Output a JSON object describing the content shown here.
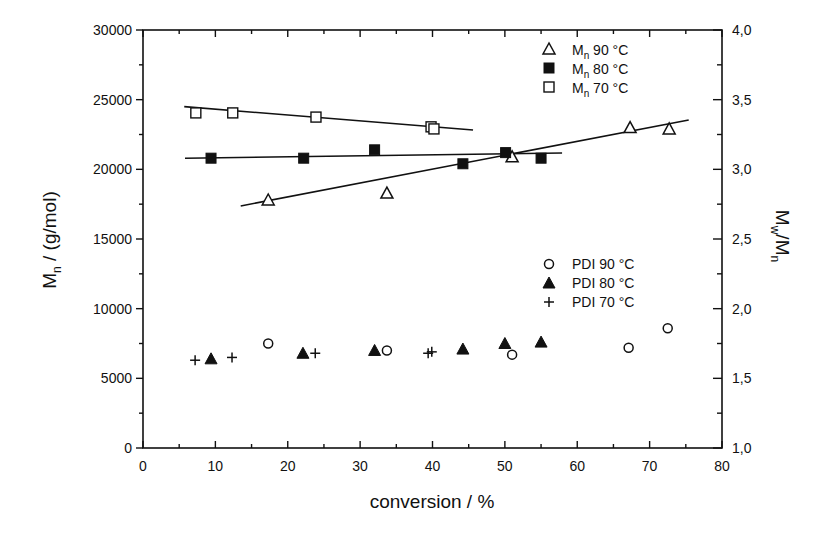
{
  "chart_data": {
    "type": "scatter",
    "title": "",
    "xlabel": "conversion / %",
    "ylabel": {
      "main": "M",
      "sub": "n",
      "rest": " / (g/mol)"
    },
    "y2label": {
      "m1": "M",
      "sub1": "w",
      "slash": "/M",
      "sub2": "n"
    },
    "xlim": [
      0,
      80
    ],
    "ylim": [
      0,
      30000
    ],
    "y2lim": [
      1.0,
      4.0
    ],
    "grid": false,
    "x_ticks": [
      "0",
      "10",
      "20",
      "30",
      "40",
      "50",
      "60",
      "70",
      "80"
    ],
    "y_ticks": [
      "0",
      "5000",
      "10000",
      "15000",
      "20000",
      "25000",
      "30000"
    ],
    "y2_ticks": [
      "1,0",
      "1,5",
      "2,0",
      "2,5",
      "3,0",
      "3,5",
      "4,0"
    ],
    "legend_position": "upper right (Mn) / middle right (PDI)",
    "series": [
      {
        "name": "Mn 90 °C",
        "legend_main": "M",
        "legend_sub": "n",
        "legend_rest": " 90 °C",
        "axis": "left",
        "marker": "open-triangle",
        "x": [
          17.3,
          33.7,
          51.0,
          67.3,
          72.7
        ],
        "y": [
          17800,
          18300,
          20900,
          23000,
          22900
        ],
        "fit_line": {
          "x": [
            13.5,
            75.4
          ],
          "y": [
            17370,
            23540
          ]
        }
      },
      {
        "name": "Mn 80 °C",
        "legend_main": "M",
        "legend_sub": "n",
        "legend_rest": " 80 °C",
        "axis": "left",
        "marker": "filled-square",
        "x": [
          9.4,
          22.2,
          32.0,
          44.2,
          50.1,
          55.0
        ],
        "y": [
          20800,
          20800,
          21400,
          20400,
          21200,
          20800
        ],
        "fit_line": {
          "x": [
            5.8,
            57.9
          ],
          "y": [
            20800,
            21170
          ]
        }
      },
      {
        "name": "Mn 70 °C",
        "legend_main": "M",
        "legend_sub": "n",
        "legend_rest": " 70 °C",
        "axis": "left",
        "marker": "open-square",
        "x": [
          7.3,
          12.4,
          23.9,
          39.8,
          40.2
        ],
        "y": [
          24050,
          24050,
          23750,
          23050,
          22900
        ],
        "fit_line": {
          "x": [
            5.7,
            45.6
          ],
          "y": [
            24500,
            22820
          ]
        }
      },
      {
        "name": "PDI 90 °C",
        "legend_main": "PDI 90 °C",
        "axis": "right",
        "marker": "open-circle",
        "x": [
          17.3,
          33.7,
          51.0,
          67.1,
          72.5
        ],
        "y": [
          1.75,
          1.7,
          1.67,
          1.72,
          1.86
        ]
      },
      {
        "name": "PDI 80 °C",
        "legend_main": "PDI 80 °C",
        "axis": "right",
        "marker": "filled-triangle",
        "x": [
          9.4,
          22.1,
          32.0,
          44.2,
          50.0,
          55.0
        ],
        "y": [
          1.64,
          1.68,
          1.7,
          1.71,
          1.75,
          1.76
        ]
      },
      {
        "name": "PDI 70 °C",
        "legend_main": "PDI 70 °C",
        "axis": "right",
        "marker": "plus",
        "x": [
          7.2,
          12.3,
          23.8,
          39.4,
          39.9
        ],
        "y": [
          1.63,
          1.65,
          1.68,
          1.68,
          1.69
        ]
      }
    ]
  },
  "colors": {
    "ink": "#111111",
    "background": "#ffffff"
  }
}
